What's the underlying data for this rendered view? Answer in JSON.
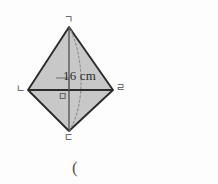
{
  "figure": {
    "kind": "cone-geometry-diagram",
    "labels": {
      "apex": "ㄱ",
      "left": "ㄴ",
      "right": "ㄹ",
      "bottom": "ㄷ",
      "center": "ㅁ"
    },
    "measurement": "16 cm",
    "trailing_paren": "(",
    "colors": {
      "fill": "#c8c8c8",
      "outline": "#2b2b2b",
      "axis": "#3b3b3b",
      "hidden_edge": "#8d8d8d",
      "background": "#fdfdfd",
      "label_text": "#4a4a4a"
    },
    "geometry": {
      "apex_point": [
        69,
        27
      ],
      "left_point": [
        28,
        90
      ],
      "right_point": [
        113,
        90
      ],
      "bottom_point": [
        69,
        131
      ],
      "center_point": [
        69,
        90
      ],
      "right_angle_marker": true,
      "hidden_base_arc": true,
      "vertical_axis": true
    }
  }
}
